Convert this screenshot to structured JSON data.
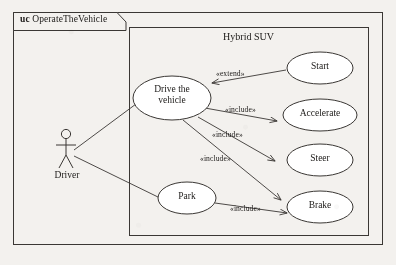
{
  "diagram": {
    "kind": "uml-use-case-diagram",
    "frame": {
      "tab_keyword": "uc",
      "tab_name": "OperateTheVehicle"
    },
    "system_boundary": {
      "name": "Hybrid SUV"
    },
    "actors": [
      {
        "id": "driver",
        "label": "Driver"
      }
    ],
    "use_cases": [
      {
        "id": "drive",
        "label": "Drive the\nvehicle",
        "line1": "Drive the",
        "line2": "vehicle"
      },
      {
        "id": "park",
        "label": "Park"
      },
      {
        "id": "start",
        "label": "Start"
      },
      {
        "id": "accelerate",
        "label": "Accelerate"
      },
      {
        "id": "steer",
        "label": "Steer"
      },
      {
        "id": "brake",
        "label": "Brake"
      }
    ],
    "associations": [
      {
        "from": "driver",
        "to": "drive"
      },
      {
        "from": "driver",
        "to": "park"
      }
    ],
    "relationships": [
      {
        "from": "start",
        "to": "drive",
        "stereotype": "«extend»"
      },
      {
        "from": "drive",
        "to": "accelerate",
        "stereotype": "«include»"
      },
      {
        "from": "drive",
        "to": "steer",
        "stereotype": "«include»"
      },
      {
        "from": "drive",
        "to": "brake",
        "stereotype": "«include»"
      },
      {
        "from": "park",
        "to": "brake",
        "stereotype": "«include»"
      }
    ],
    "stereotype_labels": {
      "extend_start_drive": "«extend»",
      "include_drive_accelerate": "«include»",
      "include_drive_steer": "«include»",
      "include_drive_brake": "«include»",
      "include_park_brake": "«include»"
    },
    "colors": {
      "background": "#f3f1ee",
      "stroke": "#3a3734",
      "text": "#1c1a18",
      "shape_fill": "#ffffff"
    }
  }
}
